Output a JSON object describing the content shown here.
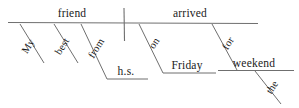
{
  "diagram": {
    "type": "reed-kellogg-sentence-diagram",
    "sentence": "My best friend from h.s. arrived on Friday for the weekend.",
    "colors": {
      "background": "#ffffff",
      "line": "#6f6f6f",
      "text": "#1a1a1a"
    },
    "baseline": {
      "subject": {
        "word": "friend",
        "x": 72,
        "y": 17
      },
      "verb": {
        "word": "arrived",
        "x": 190,
        "y": 17
      }
    },
    "modifiers": [
      {
        "word": "My",
        "x": 31,
        "y": 48,
        "rotation": -58,
        "role": "subject-modifier"
      },
      {
        "word": "best",
        "x": 65,
        "y": 48,
        "rotation": -58,
        "role": "subject-modifier"
      },
      {
        "word": "from",
        "x": 99,
        "y": 48,
        "rotation": -58,
        "role": "preposition"
      },
      {
        "word": "h.s.",
        "x": 126,
        "y": 68,
        "rotation": 0,
        "role": "object-of-preposition"
      },
      {
        "word": "on",
        "x": 158,
        "y": 45,
        "rotation": -58,
        "role": "preposition"
      },
      {
        "word": "Friday",
        "x": 184,
        "y": 62,
        "rotation": 0,
        "role": "object-of-preposition"
      },
      {
        "word": "for",
        "x": 234,
        "y": 45,
        "rotation": -58,
        "role": "preposition"
      },
      {
        "word": "weekend",
        "x": 248,
        "y": 66,
        "rotation": 0,
        "role": "object-of-preposition"
      },
      {
        "word": "the",
        "x": 276,
        "y": 88,
        "rotation": -58,
        "role": "article-modifier"
      }
    ]
  }
}
